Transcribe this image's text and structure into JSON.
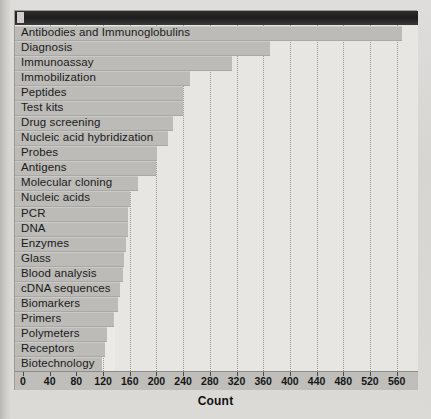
{
  "chart_data": {
    "type": "bar",
    "orientation": "horizontal",
    "title": "",
    "xlabel": "Count",
    "ylabel": "",
    "xlim": [
      0,
      580
    ],
    "xticks": [
      0,
      40,
      80,
      120,
      160,
      200,
      240,
      280,
      320,
      360,
      400,
      440,
      480,
      520,
      560
    ],
    "grid": true,
    "legend": null,
    "categories": [
      "Antibodies and Immunoglobulins",
      "Diagnosis",
      "Immunoassay",
      "Immobilization",
      "Peptides",
      "Test kits",
      "Drug screening",
      "Nucleic acid hybridization",
      "Probes",
      "Antigens",
      "Molecular cloning",
      "Nucleic acids",
      "PCR",
      "DNA",
      "Enzymes",
      "Glass",
      "Blood analysis",
      "cDNA sequences",
      "Biomarkers",
      "Primers",
      "Polymeters",
      "Receptors",
      "Biotechnology"
    ],
    "values": [
      568,
      370,
      313,
      250,
      240,
      240,
      225,
      218,
      201,
      200,
      173,
      161,
      158,
      158,
      155,
      152,
      150,
      146,
      142,
      137,
      126,
      123,
      119
    ]
  },
  "axis": {
    "tick_labels": [
      "0",
      "40",
      "80",
      "120",
      "160",
      "200",
      "240",
      "280",
      "320",
      "360",
      "400",
      "440",
      "480",
      "520",
      "560"
    ],
    "xlabel": "Count"
  },
  "colors": {
    "bar": "#bcbbb8",
    "plot_background": "#e7e6e3",
    "axis_background": "#bfbeba",
    "grid": "#8e8d8a",
    "page_background": "#d9d9d6",
    "header_band": "#1d1d1d"
  }
}
